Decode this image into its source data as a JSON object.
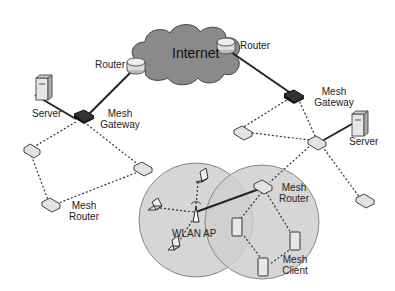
{
  "diagram": {
    "cloud": {
      "label": "Internet",
      "fill": "#8a8a8a"
    },
    "labels": {
      "router_left": "Router",
      "router_right": "Router",
      "server_left": "Server",
      "server_right": "Server",
      "gateway_left_1": "Mesh",
      "gateway_left_2": "Gateway",
      "gateway_right_1": "Mesh",
      "gateway_right_2": "Gateway",
      "mesh_router_left_1": "Mesh",
      "mesh_router_left_2": "Router",
      "mesh_router_right_1": "Mesh",
      "mesh_router_right_2": "Router",
      "wlan_ap": "WLAN AP",
      "mesh_client_1": "Mesh",
      "mesh_client_2": "Client"
    },
    "colors": {
      "circle_fill": "#d4d4d4",
      "line": "#222222",
      "device": "#e2e2e2"
    }
  }
}
